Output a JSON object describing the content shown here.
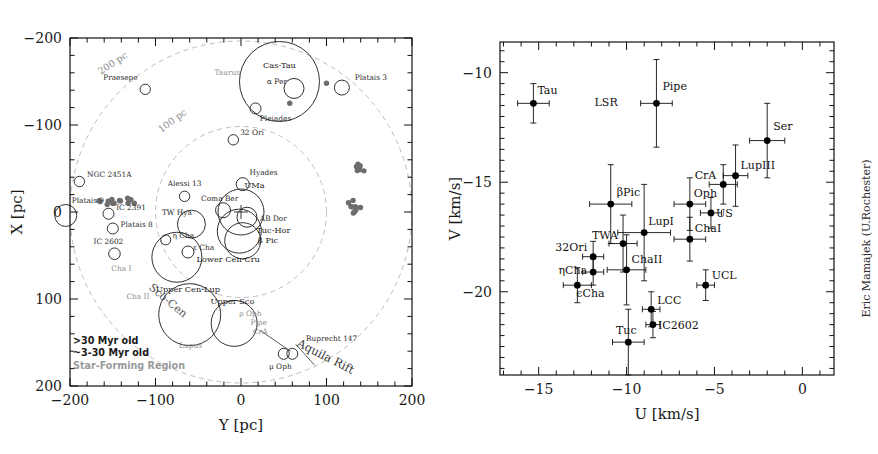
{
  "figure": {
    "credit": "Eric Mamajek (U.Rochester)"
  },
  "chart_data": [
    {
      "id": "left",
      "type": "scatter",
      "title": "",
      "xlabel": "Y [pc]",
      "ylabel": "X [pc]",
      "xlim": [
        -200,
        200
      ],
      "ylim": [
        200,
        -200
      ],
      "xticks": [
        -200,
        -100,
        0,
        100,
        200
      ],
      "yticks": [
        -200,
        -100,
        0,
        100,
        200
      ],
      "xticklabels": [
        "-200",
        "-100",
        "0",
        "100",
        "200"
      ],
      "yticklabels": [
        "-200",
        "-100",
        "0",
        "100",
        "200"
      ],
      "grid": false,
      "legend_position": "lower-left",
      "legend": [
        {
          "label": ">30 Myr old",
          "marker": "open-circle",
          "color": "#222222"
        },
        {
          "label": "~3-30 Myr old",
          "marker": "open-circle",
          "color": "#222222"
        },
        {
          "label": "Star-Forming Region",
          "marker": "filled-circle",
          "color": "#9a9a9a"
        }
      ],
      "annotations": [
        {
          "text": "200 pc",
          "x": -148,
          "y": -168,
          "rot": -33,
          "kind": "distance-ring"
        },
        {
          "text": "100 pc",
          "x": -78,
          "y": -102,
          "rot": -37,
          "kind": "distance-ring"
        },
        {
          "text": "Sco-Cen",
          "x": -88,
          "y": 105,
          "rot": 40,
          "kind": "region"
        },
        {
          "text": "Aquila Rift",
          "x": 97,
          "y": 170,
          "rot": 27,
          "kind": "region"
        }
      ],
      "rings": [
        {
          "label": "100 pc",
          "radius_pc": 100
        },
        {
          "label": "200 pc",
          "radius_pc": 200
        }
      ],
      "points": [
        {
          "name": "Praesepe",
          "y": -112,
          "x": -141,
          "r": 5.2,
          "cls": "old",
          "lx": -141,
          "ly": -152,
          "anchor": "middle"
        },
        {
          "name": "Taurus",
          "y": -12,
          "x": -143,
          "r": 0,
          "cls": "sfr",
          "lx": -16,
          "ly": -158,
          "anchor": "middle"
        },
        {
          "name": "Cas-Tau",
          "y": 45,
          "x": -150,
          "r": 40,
          "cls": "old",
          "lx": 45,
          "ly": -165,
          "anchor": "middle"
        },
        {
          "name": "alpha Per",
          "y": 62,
          "x": -142,
          "r": 10,
          "cls": "old",
          "lx": 42,
          "ly": -147,
          "anchor": "middle"
        },
        {
          "name": "Platais 3",
          "y": 118,
          "x": -143,
          "r": 7.5,
          "cls": "old",
          "lx": 133,
          "ly": -152,
          "anchor": "start"
        },
        {
          "name": "Pleiades",
          "y": 17,
          "x": -119,
          "r": 5.5,
          "cls": "old",
          "lx": 22,
          "ly": -105,
          "anchor": "start"
        },
        {
          "name": "32 Ori",
          "y": -9,
          "x": -83,
          "r": 5.2,
          "cls": "young",
          "lx": -1,
          "ly": -89,
          "anchor": "start"
        },
        {
          "name": "NGC 2451A",
          "y": -189,
          "x": -35,
          "r": 5.2,
          "cls": "old",
          "lx": -180,
          "ly": -40,
          "anchor": "start"
        },
        {
          "name": "Hyades",
          "y": 2,
          "x": -32,
          "r": 6.5,
          "cls": "old",
          "lx": 10,
          "ly": -42,
          "anchor": "start"
        },
        {
          "name": "Alessi 13",
          "y": -66,
          "x": -18,
          "r": 5.2,
          "cls": "old",
          "lx": -66,
          "ly": -30,
          "anchor": "middle"
        },
        {
          "name": "Platais 9",
          "y": -205,
          "x": 4,
          "r": 11,
          "cls": "old",
          "lx": -198,
          "ly": -10,
          "anchor": "start"
        },
        {
          "name": "UMa",
          "y": 0,
          "x": 0,
          "r": 23,
          "cls": "old",
          "lx": 4,
          "ly": -28,
          "anchor": "start"
        },
        {
          "name": "Coma Ber",
          "y": -21,
          "x": -2,
          "r": 7.5,
          "cls": "old",
          "lx": -25,
          "ly": -13,
          "anchor": "middle"
        },
        {
          "name": "IC 2391",
          "y": -155,
          "x": 2,
          "r": 5.5,
          "cls": "old",
          "lx": -146,
          "ly": -2,
          "anchor": "start"
        },
        {
          "name": "TW Hya",
          "y": -58,
          "x": 14,
          "r": 14,
          "cls": "young",
          "lx": -75,
          "ly": 4,
          "anchor": "middle"
        },
        {
          "name": "AB Dor",
          "y": 7,
          "x": 6,
          "r": 10,
          "cls": "old",
          "lx": 22,
          "ly": 10,
          "anchor": "start"
        },
        {
          "name": "Platais 8",
          "y": -150,
          "x": 19,
          "r": 5.5,
          "cls": "old",
          "lx": -141,
          "ly": 17,
          "anchor": "start"
        },
        {
          "name": "Tuc-Hor",
          "y": -2,
          "x": 22,
          "r": 22,
          "cls": "young",
          "lx": 18,
          "ly": 24,
          "anchor": "start"
        },
        {
          "name": "beta Pic",
          "y": 2,
          "x": 33,
          "r": 18,
          "cls": "young",
          "lx": 20,
          "ly": 36,
          "anchor": "start"
        },
        {
          "name": "eta Cha",
          "y": -88,
          "x": 32,
          "r": 5.0,
          "cls": "young",
          "lx": -80,
          "ly": 30,
          "anchor": "start"
        },
        {
          "name": "IC 2602",
          "y": -148,
          "x": 48,
          "r": 5.8,
          "cls": "old",
          "lx": -155,
          "ly": 37,
          "anchor": "middle"
        },
        {
          "name": "epsilon Cha",
          "y": -62,
          "x": 46,
          "r": 6.0,
          "cls": "young",
          "lx": -56,
          "ly": 44,
          "anchor": "start"
        },
        {
          "name": "Lower Cen-Cru",
          "y": -75,
          "x": 52,
          "r": 25,
          "cls": "young",
          "lx": -52,
          "ly": 57,
          "anchor": "start"
        },
        {
          "name": "Cha I",
          "y": -125,
          "x": 57,
          "r": 0,
          "cls": "sfr",
          "lx": -140,
          "ly": 68,
          "anchor": "middle"
        },
        {
          "name": "Cha II",
          "y": -148,
          "x": 100,
          "r": 0,
          "cls": "sfr",
          "lx": -134,
          "ly": 100,
          "anchor": "start"
        },
        {
          "name": "Upper Cen-Lup",
          "y": -60,
          "x": 118,
          "r": 31,
          "cls": "young",
          "lx": -62,
          "ly": 92,
          "anchor": "middle"
        },
        {
          "name": "Upper Sco",
          "y": -8,
          "x": 128,
          "r": 23,
          "cls": "young",
          "lx": -10,
          "ly": 106,
          "anchor": "middle"
        },
        {
          "name": "rho Oph",
          "y": -9,
          "x": 129,
          "r": 0,
          "cls": "sfr",
          "lx": -2,
          "ly": 120,
          "anchor": "start"
        },
        {
          "name": "Pipe",
          "y": 3,
          "x": 136,
          "r": 0,
          "cls": "sfr",
          "lx": 11,
          "ly": 130,
          "anchor": "start"
        },
        {
          "name": "CrA",
          "y": 10,
          "x": 140,
          "r": 0,
          "cls": "sfr",
          "lx": 14,
          "ly": 140,
          "anchor": "start"
        },
        {
          "name": "Lupus",
          "y": -53,
          "x": 142,
          "r": 0,
          "cls": "sfr",
          "lx": -59,
          "ly": 156,
          "anchor": "middle"
        },
        {
          "name": "Ruprecht 147",
          "y": 60,
          "x": 163,
          "r": 5.5,
          "cls": "old",
          "lx": 76,
          "ly": 148,
          "anchor": "start"
        },
        {
          "name": "mu Oph",
          "y": 50,
          "x": 163,
          "r": 5.5,
          "cls": "old",
          "lx": 46,
          "ly": 180,
          "anchor": "middle"
        }
      ],
      "sfr_clumps": [
        {
          "name": "Taurus",
          "cy": -143,
          "cx": -12,
          "n": 13,
          "spread_y": 23,
          "spread_x": 4
        },
        {
          "name": "Lupus",
          "cy": 141,
          "cx": -52,
          "n": 7,
          "spread_y": 6,
          "spread_x": 5
        },
        {
          "name": "rho Oph",
          "cy": 128,
          "cx": -10,
          "n": 4,
          "spread_y": 4,
          "spread_x": 4
        },
        {
          "name": "Pipe",
          "cy": 136,
          "cx": -2,
          "n": 5,
          "spread_y": 5,
          "spread_x": 4
        },
        {
          "name": "Cha I",
          "cy": 57,
          "cx": -125,
          "n": 1,
          "spread_y": 0,
          "spread_x": 0
        },
        {
          "name": "Cha II",
          "cy": 100,
          "cx": -148,
          "n": 1,
          "spread_y": 0,
          "spread_x": 0
        }
      ]
    },
    {
      "id": "right",
      "type": "scatter",
      "title": "",
      "xlabel": "U [km/s]",
      "ylabel": "V [km/s]",
      "xlim": [
        -17.2,
        1.8
      ],
      "ylim": [
        -23.8,
        -8.6
      ],
      "xticks": [
        -15,
        -10,
        -5,
        0
      ],
      "yticks": [
        -10,
        -15,
        -20
      ],
      "xticklabels": [
        "-15",
        "-10",
        "-5",
        "0"
      ],
      "yticklabels": [
        "-10",
        "-15",
        "-20"
      ],
      "grid": false,
      "legend_position": "none",
      "points": [
        {
          "name": "Tau",
          "u": -15.3,
          "v": -11.4,
          "eu": 0.9,
          "ev": 0.9,
          "lx": 4,
          "ly": -9,
          "anchor": "start"
        },
        {
          "name": "LSR",
          "u": -10.0,
          "v": -11.4,
          "eu": 0.0,
          "ev": 0.0,
          "lx": -32,
          "ly": 3,
          "anchor": "start",
          "no_marker": true
        },
        {
          "name": "Pipe",
          "u": -8.3,
          "v": -11.4,
          "eu": 0.9,
          "ev": 2.0,
          "lx": 6,
          "ly": -13,
          "anchor": "start"
        },
        {
          "name": "Ser",
          "u": -2.0,
          "v": -13.1,
          "eu": 1.0,
          "ev": 1.7,
          "lx": 6,
          "ly": -11,
          "anchor": "start"
        },
        {
          "name": "LupIII",
          "u": -3.8,
          "v": -14.7,
          "eu": 0.7,
          "ev": 1.4,
          "lx": 5,
          "ly": -7,
          "anchor": "start"
        },
        {
          "name": "CrA",
          "u": -4.5,
          "v": -15.1,
          "eu": 0.8,
          "ev": 0.9,
          "lx": -7,
          "ly": -5,
          "anchor": "end"
        },
        {
          "name": "Oph",
          "u": -6.4,
          "v": -16.0,
          "eu": 0.9,
          "ev": 1.2,
          "lx": 4,
          "ly": -7,
          "anchor": "start"
        },
        {
          "name": "US",
          "u": -5.2,
          "v": -16.4,
          "eu": 0.6,
          "ev": 0.7,
          "lx": 5,
          "ly": 4,
          "anchor": "start"
        },
        {
          "name": "bPic",
          "u": -10.9,
          "v": -16.0,
          "eu": 1.2,
          "ev": 1.8,
          "lx": 6,
          "ly": -8,
          "anchor": "start",
          "display": "βPic"
        },
        {
          "name": "LupI",
          "u": -9.0,
          "v": -17.3,
          "eu": 1.5,
          "ev": 2.2,
          "lx": 4,
          "ly": -8,
          "anchor": "start"
        },
        {
          "name": "TWA",
          "u": -10.2,
          "v": -17.8,
          "eu": 0.8,
          "ev": 1.3,
          "lx": -5,
          "ly": -5,
          "anchor": "end"
        },
        {
          "name": "ChaI",
          "u": -6.4,
          "v": -17.6,
          "eu": 0.9,
          "ev": 1.0,
          "lx": 5,
          "ly": -7,
          "anchor": "start"
        },
        {
          "name": "32Ori",
          "u": -11.9,
          "v": -18.4,
          "eu": 0.6,
          "ev": 0.7,
          "lx": -6,
          "ly": -6,
          "anchor": "end"
        },
        {
          "name": "ChaII",
          "u": -10.0,
          "v": -19.0,
          "eu": 1.1,
          "ev": 1.6,
          "lx": 5,
          "ly": -7,
          "anchor": "start"
        },
        {
          "name": "etaCha",
          "u": -11.9,
          "v": -19.1,
          "eu": 0.6,
          "ev": 0.6,
          "lx": -6,
          "ly": 2,
          "anchor": "end",
          "display": "ηCha"
        },
        {
          "name": "eCha",
          "u": -12.8,
          "v": -19.7,
          "eu": 0.8,
          "ev": 0.8,
          "lx": -1,
          "ly": 12,
          "anchor": "start",
          "display": "ϵCha"
        },
        {
          "name": "UCL",
          "u": -5.5,
          "v": -19.7,
          "eu": 0.5,
          "ev": 0.7,
          "lx": 6,
          "ly": -6,
          "anchor": "start"
        },
        {
          "name": "LCC",
          "u": -8.6,
          "v": -20.8,
          "eu": 0.5,
          "ev": 0.8,
          "lx": 6,
          "ly": -5,
          "anchor": "start"
        },
        {
          "name": "IC2602",
          "u": -8.5,
          "v": -21.5,
          "eu": 0.4,
          "ev": 0.6,
          "lx": 5,
          "ly": 4,
          "anchor": "start"
        },
        {
          "name": "Tuc",
          "u": -9.9,
          "v": -22.3,
          "eu": 0.9,
          "ev": 1.5,
          "lx": -2,
          "ly": -8,
          "anchor": "middle"
        }
      ]
    }
  ]
}
